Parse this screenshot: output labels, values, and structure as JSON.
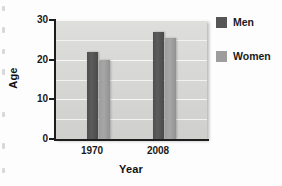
{
  "chart_data": {
    "type": "bar",
    "title": "",
    "xlabel": "Year",
    "ylabel": "Age",
    "categories": [
      "1970",
      "2008"
    ],
    "series": [
      {
        "name": "Men",
        "values": [
          22,
          27
        ],
        "color": "#565656"
      },
      {
        "name": "Women",
        "values": [
          20,
          25.5
        ],
        "color": "#9d9d9d"
      }
    ],
    "ylim": [
      0,
      30
    ],
    "yticks": [
      0,
      10,
      20,
      30
    ],
    "ytick_labels": [
      "0",
      "10",
      "20",
      "30"
    ],
    "minor_gridlines": [
      5,
      15,
      25
    ],
    "grid": true,
    "legend_position": "right",
    "plot_background": "#d7d7d6",
    "gridline_color": "#f7f7f5",
    "axis_color": "#1d1d1d"
  },
  "legend": {
    "entries": [
      {
        "label": "Men",
        "color": "#565656"
      },
      {
        "label": "Women",
        "color": "#9d9d9d"
      }
    ]
  },
  "axes": {
    "y_title": "Age",
    "x_title": "Year",
    "y_labels": {
      "t0": "0",
      "t10": "10",
      "t20": "20",
      "t30": "30"
    },
    "x_labels": {
      "c0": "1970",
      "c1": "2008"
    }
  }
}
